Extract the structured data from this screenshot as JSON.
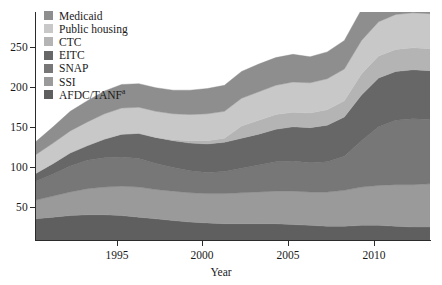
{
  "chart_data": {
    "type": "area",
    "title": "",
    "subtitle": "",
    "xlabel": "Year",
    "ylabel": "",
    "stacked": true,
    "grid": false,
    "legend_position": "top-left",
    "xlim": [
      1990,
      2013
    ],
    "ylim": [
      0,
      280
    ],
    "xticks": [
      1995,
      2000,
      2005,
      2010
    ],
    "xtick_labels": [
      "1995",
      "2000",
      "2005",
      "2010"
    ],
    "yticks": [
      50,
      100,
      150,
      200,
      250
    ],
    "ytick_labels": [
      "50",
      "100",
      "150",
      "200",
      "250"
    ],
    "x": [
      1990,
      1991,
      1992,
      1993,
      1994,
      1995,
      1996,
      1997,
      1998,
      1999,
      2000,
      2001,
      2002,
      2003,
      2004,
      2005,
      2006,
      2007,
      2008,
      2009,
      2010,
      2011,
      2012,
      2013
    ],
    "series": [
      {
        "name": "AFDC/TANF",
        "color": "#5f5f5f",
        "stack_order": 1,
        "values": [
          26,
          28,
          30,
          31,
          31,
          30,
          28,
          26,
          24,
          22,
          21,
          20,
          20,
          20,
          20,
          19,
          18,
          17,
          17,
          18,
          18,
          17,
          16,
          16
        ]
      },
      {
        "name": "SSI",
        "color": "#9a9a9a",
        "stack_order": 2,
        "values": [
          23,
          26,
          29,
          32,
          34,
          36,
          37,
          36,
          36,
          36,
          36,
          37,
          38,
          39,
          40,
          41,
          41,
          42,
          44,
          47,
          49,
          51,
          52,
          53
        ]
      },
      {
        "name": "SNAP",
        "color": "#777777",
        "stack_order": 3,
        "values": [
          23,
          27,
          32,
          35,
          36,
          36,
          35,
          32,
          29,
          27,
          26,
          27,
          30,
          33,
          36,
          37,
          36,
          37,
          42,
          57,
          72,
          79,
          81,
          79
        ]
      },
      {
        "name": "EITC",
        "color": "#676767",
        "stack_order": 4,
        "values": [
          10,
          13,
          16,
          18,
          23,
          28,
          31,
          32,
          33,
          34,
          35,
          36,
          37,
          38,
          40,
          42,
          43,
          45,
          48,
          56,
          60,
          60,
          60,
          60
        ]
      },
      {
        "name": "CTC",
        "color": "#b4b4b4",
        "stack_order": 5,
        "values": [
          0,
          0,
          0,
          0,
          0,
          0,
          0,
          0,
          1,
          3,
          4,
          5,
          15,
          17,
          18,
          18,
          18,
          19,
          20,
          26,
          27,
          27,
          27,
          27
        ]
      },
      {
        "name": "Public housing",
        "color": "#c8c8c8",
        "stack_order": 6,
        "values": [
          23,
          25,
          27,
          29,
          31,
          32,
          32,
          32,
          32,
          32,
          33,
          33,
          34,
          35,
          36,
          37,
          37,
          38,
          39,
          41,
          42,
          43,
          43,
          43
        ]
      },
      {
        "name": "Medicaid",
        "color": "#8e8e8e",
        "stack_order": 7,
        "values": [
          16,
          20,
          24,
          26,
          28,
          29,
          29,
          29,
          29,
          30,
          31,
          32,
          33,
          34,
          34,
          34,
          32,
          33,
          35,
          38,
          40,
          40,
          40,
          41
        ]
      }
    ],
    "legend_entries": [
      {
        "label": "Medicaid",
        "color": "#8e8e8e"
      },
      {
        "label": "Public housing",
        "color": "#c8c8c8"
      },
      {
        "label": "CTC",
        "color": "#b4b4b4"
      },
      {
        "label": "EITC",
        "color": "#676767"
      },
      {
        "label": "SNAP",
        "color": "#777777"
      },
      {
        "label": "SSI",
        "color": "#9a9a9a"
      },
      {
        "label": "AFDC/TANF",
        "color": "#5f5f5f",
        "superscript": "a"
      }
    ]
  },
  "axes": {
    "x_title": "Year",
    "x_tick_labels": [
      "1995",
      "2000",
      "2005",
      "2010"
    ],
    "y_tick_labels": [
      "250",
      "200",
      "150",
      "100",
      "50"
    ]
  },
  "legend": {
    "items": [
      {
        "label": "Medicaid"
      },
      {
        "label": "Public housing"
      },
      {
        "label": "CTC"
      },
      {
        "label": "EITC"
      },
      {
        "label": "SNAP"
      },
      {
        "label": "SSI"
      },
      {
        "label": "AFDC/TANF",
        "sup": "a"
      }
    ]
  }
}
